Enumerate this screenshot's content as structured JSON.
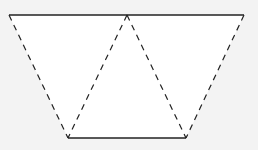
{
  "diagram": {
    "colors": {
      "background": "#f3f3f3",
      "fill": "#ffffff",
      "stroke": "#222222"
    },
    "solid_edges": [
      "top",
      "bottom"
    ],
    "dashed_edges": [
      "left-side",
      "inner-left",
      "inner-right",
      "right-side"
    ]
  }
}
